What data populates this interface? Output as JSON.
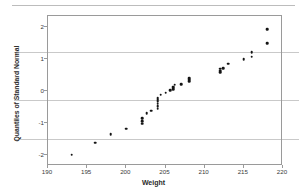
{
  "chart_data": {
    "type": "scatter",
    "title": "",
    "subtitle": "",
    "xlabel": "Weight",
    "ylabel": "Quantiles of Standard Normal",
    "xlim": [
      190,
      220
    ],
    "ylim": [
      -2.35,
      2.35
    ],
    "xticks": [
      190,
      195,
      200,
      205,
      210,
      215,
      220
    ],
    "yticks": [
      2,
      1,
      0,
      -1,
      -2
    ],
    "grid": true,
    "grid_axis": "y",
    "gridlines_y": [
      1.2,
      -0.3,
      -1.55
    ],
    "legend": null,
    "legend_position": "none",
    "series": [
      {
        "name": "Normal quantile plot",
        "marker": "filled-circle",
        "color": "#141414",
        "x": [
          193,
          196,
          198,
          200,
          202,
          202,
          202,
          202.6,
          203.2,
          204,
          204,
          204,
          204,
          204,
          204,
          204.4,
          205,
          205.6,
          206,
          206,
          206,
          206.2,
          207,
          208,
          208,
          208,
          212,
          212,
          212,
          212.4,
          213,
          215,
          216,
          216,
          218,
          218
        ],
        "y": [
          -2.0,
          -1.62,
          -1.36,
          -1.18,
          -1.02,
          -0.94,
          -0.86,
          -0.7,
          -0.62,
          -0.55,
          -0.47,
          -0.4,
          -0.33,
          -0.28,
          -0.22,
          -0.12,
          -0.05,
          0.02,
          0.06,
          0.1,
          0.14,
          0.2,
          0.22,
          0.3,
          0.35,
          0.4,
          0.58,
          0.64,
          0.7,
          0.72,
          0.86,
          0.99,
          1.08,
          1.22,
          1.5,
          1.93
        ]
      }
    ]
  },
  "axes": {
    "x_tick_labels": [
      "190",
      "195",
      "200",
      "205",
      "210",
      "215",
      "220"
    ],
    "y_tick_labels": [
      "2",
      "1",
      "0",
      "-1",
      "-2"
    ],
    "x_axis_title": "Weight",
    "y_axis_title": "Quantiles of Standard Normal"
  },
  "colors": {
    "marker": "#141414",
    "gridline": "#c9c9c9",
    "frame": "#9a9a9a",
    "top_rule": "#bcbcbc",
    "text": "#2b2b2b",
    "background": "#ffffff"
  }
}
